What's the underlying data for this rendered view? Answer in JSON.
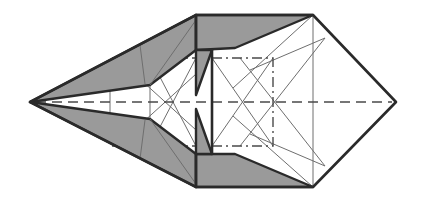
{
  "diagram": {
    "colors": {
      "paper_front": "#ffffff",
      "paper_back": "#9a9a9a",
      "outline": "#2a2a2a",
      "crease": "#6e6e6e",
      "fold_line": "#4a4a4a"
    },
    "line_legend": {
      "thick": "paper edge",
      "thin": "existing crease",
      "dashed": "valley fold",
      "dash_dot": "mountain fold"
    },
    "shapes": {
      "left_tip": [
        30,
        102
      ],
      "right_tip": [
        396,
        102
      ],
      "top_edge": [
        [
          196,
          15
        ],
        [
          313,
          15
        ]
      ],
      "bottom_edge": [
        [
          196,
          187
        ],
        [
          313,
          187
        ]
      ],
      "center_line_x": 212,
      "mountain_square": [
        [
          212,
          58
        ],
        [
          273,
          58
        ],
        [
          273,
          146
        ],
        [
          212,
          146
        ]
      ],
      "midline_y": 102
    }
  }
}
